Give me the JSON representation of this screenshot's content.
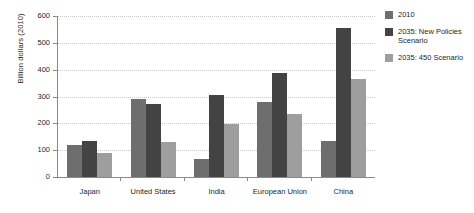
{
  "chart_data": {
    "type": "bar",
    "title": "",
    "subtitle": "",
    "xlabel": "",
    "ylabel": "Billion dollars (2010)",
    "ylim": [
      0,
      600
    ],
    "yticks": [
      0,
      100,
      200,
      300,
      400,
      500,
      600
    ],
    "ytick_labels": [
      "0",
      "100",
      "200",
      "300",
      "400",
      "500",
      "600"
    ],
    "grid": "horizontal-dotted",
    "legend_position": "right",
    "orientation": "vertical",
    "grouping": "grouped",
    "categories": [
      "Japan",
      "United States",
      "India",
      "European Union",
      "China"
    ],
    "series": [
      {
        "name": "2010",
        "color": "#6e6e6e",
        "values": [
          118,
          292,
          67,
          278,
          136
        ]
      },
      {
        "name": "2035: New Policies Scenario",
        "color": "#434343",
        "values": [
          136,
          272,
          305,
          388,
          555
        ]
      },
      {
        "name": "2035: 450 Scenario",
        "color": "#9e9e9e",
        "values": [
          88,
          131,
          196,
          235,
          367
        ]
      }
    ]
  },
  "axis": {
    "y_title": "Billion dollars (2010)"
  },
  "legend": {
    "items": [
      {
        "label": "2010",
        "color": "#6e6e6e"
      },
      {
        "label": "2035: New Policies Scenario",
        "color": "#434343"
      },
      {
        "label": "2035: 450 Scenario",
        "color": "#9e9e9e"
      }
    ]
  },
  "colors": {
    "series_2010": "#6e6e6e",
    "series_new_policies": "#434343",
    "series_450": "#9e9e9e",
    "axis": "#8a8a8a",
    "gridline": "#c9c9c9",
    "text": "#1f1f1f",
    "background": "#ffffff"
  }
}
